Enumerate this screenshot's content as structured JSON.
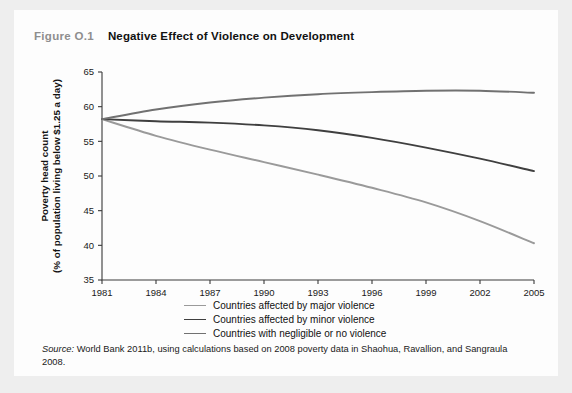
{
  "figure": {
    "number": "Figure O.1",
    "title": "Negative Effect of Violence on Development"
  },
  "source": {
    "label": "Source:",
    "text": " World Bank 2011b, using calculations based on 2008 poverty data in Shaohua, Ravallion, and Sangraula 2008."
  },
  "colors": {
    "card_background": "#fdfdfd",
    "page_background": "#eeeeee",
    "axis": "#3a3a3a",
    "series_major": "#9a9a9a",
    "series_minor": "#3f3f3f",
    "series_negligible": "#717171",
    "title_number": "#8e8e8e",
    "title_text": "#111111"
  },
  "chart_data": {
    "type": "line",
    "title": "Negative Effect of Violence on Development",
    "xlabel": "",
    "ylabel": "Poverty head count (% of population living below $1.25 a day)",
    "ylabel_line1": "Poverty head count",
    "ylabel_line2": "(% of population living below $1.25 a day)",
    "xlim": [
      1981,
      2005
    ],
    "ylim": [
      35,
      65
    ],
    "xticks": [
      1981,
      1984,
      1987,
      1990,
      1993,
      1996,
      1999,
      2002,
      2005
    ],
    "yticks": [
      35,
      40,
      45,
      50,
      55,
      60,
      65
    ],
    "grid": false,
    "legend_position": "below-axes",
    "x": [
      1981,
      1984,
      1987,
      1990,
      1993,
      1996,
      1999,
      2002,
      2005
    ],
    "series": [
      {
        "name": "Countries affected by major violence",
        "color": "#9a9a9a",
        "width": 1.9,
        "values": [
          58.2,
          55.8,
          53.8,
          52.0,
          50.2,
          48.3,
          46.2,
          43.5,
          40.3
        ]
      },
      {
        "name": "Countries affected by minor violence",
        "color": "#3f3f3f",
        "width": 1.9,
        "values": [
          58.2,
          57.9,
          57.7,
          57.3,
          56.6,
          55.5,
          54.1,
          52.5,
          50.7
        ]
      },
      {
        "name": "Countries with negligible or no violence",
        "color": "#717171",
        "width": 1.9,
        "values": [
          58.2,
          59.6,
          60.6,
          61.3,
          61.8,
          62.1,
          62.3,
          62.3,
          62.0
        ]
      }
    ],
    "legend": [
      {
        "label": "Countries affected by major violence",
        "color": "#9a9a9a"
      },
      {
        "label": "Countries affected by minor violence",
        "color": "#3f3f3f"
      },
      {
        "label": "Countries with negligible or no violence",
        "color": "#717171"
      }
    ]
  }
}
